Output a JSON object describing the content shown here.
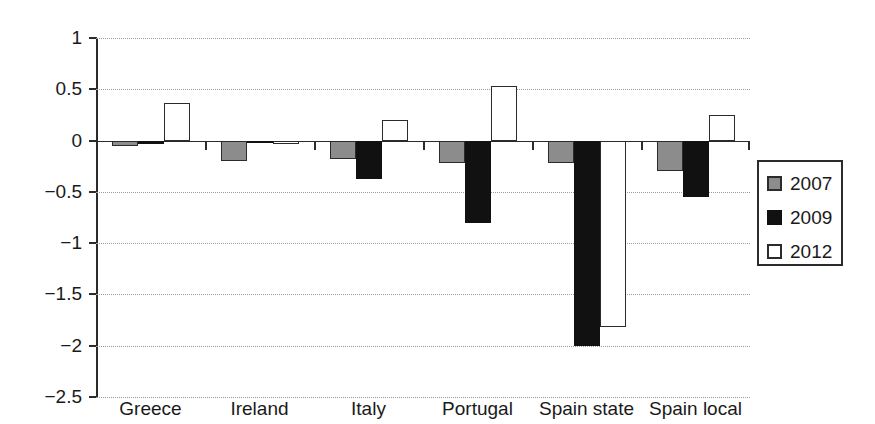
{
  "chart_data": {
    "type": "bar",
    "title": "",
    "subtitle": "",
    "xlabel": "",
    "ylabel": "",
    "categories": [
      "Greece",
      "Ireland",
      "Italy",
      "Portugal",
      "Spain state",
      "Spain local"
    ],
    "series": [
      {
        "name": "2007",
        "color": "#8c8c8c",
        "values": [
          -0.05,
          -0.2,
          -0.18,
          -0.22,
          -0.22,
          -0.3
        ]
      },
      {
        "name": "2009",
        "color": "#111111",
        "values": [
          -0.03,
          -0.01,
          -0.37,
          -0.8,
          -2.0,
          -0.55
        ]
      },
      {
        "name": "2012",
        "color": "#ffffff",
        "values": [
          0.37,
          -0.03,
          0.2,
          0.53,
          -1.82,
          0.25
        ]
      }
    ],
    "ylim": [
      -2.5,
      1
    ],
    "yticks": [
      1,
      0.5,
      0,
      -0.5,
      -1,
      -1.5,
      -2,
      -2.5
    ],
    "ytick_labels": [
      "1",
      "0.5",
      "0",
      "−0.5",
      "−1",
      "−1.5",
      "−2",
      "−2.5"
    ],
    "grid": true,
    "grid_style": "dotted",
    "legend": {
      "position": "right",
      "entries": [
        {
          "label": "2007",
          "swatch": "gray-filled-square"
        },
        {
          "label": "2009",
          "swatch": "black-filled-square"
        },
        {
          "label": "2012",
          "swatch": "white-open-square"
        }
      ]
    },
    "axis_color": "#2b2b2b",
    "background": "#ffffff"
  }
}
